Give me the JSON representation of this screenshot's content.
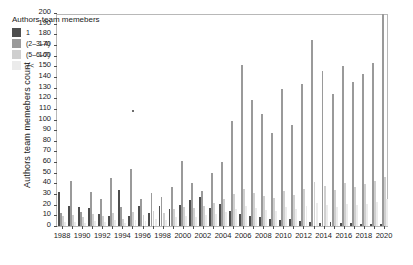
{
  "chart_data": {
    "type": "bar",
    "title": "",
    "subtitle": "",
    "xlabel": "",
    "ylabel": "Authors team memebers count",
    "ylim": [
      0,
      200
    ],
    "ytick_step": 10,
    "xlim": [
      1987.5,
      2020.5
    ],
    "xtick_step": 2,
    "grid": false,
    "legend_position": "top-left",
    "legend_title": "Authors team memebers",
    "categories": [
      1988,
      1989,
      1990,
      1991,
      1992,
      1993,
      1994,
      1995,
      1996,
      1997,
      1998,
      1999,
      2000,
      2001,
      2002,
      2003,
      2004,
      2005,
      2006,
      2007,
      2008,
      2009,
      2010,
      2011,
      2012,
      2013,
      2014,
      2015,
      2016,
      2017,
      2018,
      2019,
      2020
    ],
    "yticks": [
      0,
      10,
      20,
      30,
      40,
      50,
      60,
      70,
      80,
      90,
      100,
      110,
      120,
      130,
      140,
      150,
      160,
      170,
      180,
      190,
      200
    ],
    "xticks": [
      1988,
      1990,
      1992,
      1994,
      1996,
      1998,
      2000,
      2002,
      2004,
      2006,
      2008,
      2010,
      2012,
      2014,
      2016,
      2018,
      2020
    ],
    "colors": {
      "series_1": "#4d4d4d",
      "series_2": "#9a9a9a",
      "series_3": "#cfcfcf",
      "series_4": "#ebebeb",
      "axis": "#4d4d4d",
      "frame": "#b8b8b8",
      "text": "#1a1a1a",
      "background": "#ffffff"
    },
    "series": [
      {
        "name": "1",
        "values": [
          32,
          19,
          18,
          17,
          11,
          9,
          34,
          9,
          19,
          12,
          19,
          16,
          20,
          24,
          27,
          17,
          21,
          14,
          11,
          9,
          8,
          7,
          6,
          7,
          5,
          4,
          3,
          4,
          3,
          3,
          2,
          2,
          2
        ]
      },
      {
        "name": "(2–3–4)",
        "values": [
          12,
          42,
          13,
          32,
          25,
          45,
          18,
          54,
          25,
          31,
          27,
          37,
          61,
          40,
          33,
          50,
          60,
          99,
          151,
          118,
          105,
          87,
          129,
          95,
          133,
          175,
          146,
          124,
          150,
          135,
          143,
          153,
          199
        ]
      },
      {
        "name": "(5–6–7)",
        "values": [
          9,
          10,
          8,
          11,
          9,
          12,
          7,
          13,
          10,
          14,
          12,
          16,
          18,
          17,
          19,
          22,
          25,
          30,
          35,
          31,
          28,
          26,
          33,
          29,
          35,
          41,
          38,
          34,
          40,
          37,
          39,
          42,
          46
        ]
      },
      {
        "name": "7<",
        "values": [
          4,
          4,
          3,
          5,
          4,
          6,
          3,
          6,
          5,
          7,
          6,
          8,
          9,
          8,
          10,
          11,
          13,
          16,
          19,
          17,
          15,
          14,
          18,
          16,
          19,
          22,
          20,
          18,
          21,
          20,
          21,
          23,
          25
        ]
      }
    ],
    "annotations": [
      {
        "type": "stray-marker",
        "x": 1995,
        "y": 107
      }
    ]
  },
  "legend": {
    "title": "Authors team memebers",
    "items": [
      {
        "label": "1",
        "color": "#4d4d4d"
      },
      {
        "label": "(2–3–4)",
        "color": "#9a9a9a"
      },
      {
        "label": "(5–6–7)",
        "color": "#cfcfcf"
      },
      {
        "label": "7<",
        "color": "#ebebeb"
      }
    ]
  }
}
